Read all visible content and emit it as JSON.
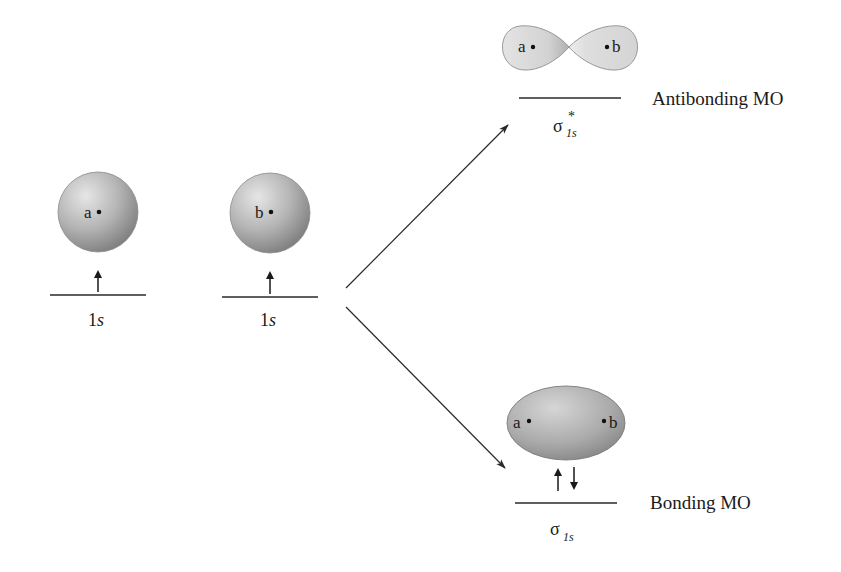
{
  "diagram": {
    "title": "",
    "atomic_orbitals": [
      {
        "id": "ao-a",
        "nucleus_label": "a",
        "level_label_num": "1",
        "level_label_letter": "s",
        "electrons": [
          "up"
        ]
      },
      {
        "id": "ao-b",
        "nucleus_label": "b",
        "level_label_num": "1",
        "level_label_letter": "s",
        "electrons": [
          "up"
        ]
      }
    ],
    "molecular_orbitals": [
      {
        "id": "antibonding",
        "name": "Antibonding MO",
        "symbol": "σ",
        "subscript": "1s",
        "superscript": "*",
        "nuclei": [
          "a",
          "b"
        ],
        "electrons": [],
        "shape": "two-lobe node"
      },
      {
        "id": "bonding",
        "name": "Bonding MO",
        "symbol": "σ",
        "subscript": "1s",
        "superscript": "",
        "nuclei": [
          "a",
          "b"
        ],
        "electrons": [
          "up",
          "down"
        ],
        "shape": "ellipsoid"
      }
    ],
    "colors": {
      "orbital_fill_light": "#e2e2e2",
      "orbital_fill_dark": "#8e8e8e",
      "line": "#2a2a2a",
      "text": "#1a1a1a"
    }
  }
}
